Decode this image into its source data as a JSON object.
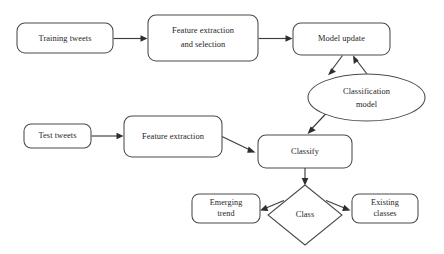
{
  "diagram": {
    "type": "flowchart",
    "colors": {
      "background": "#ffffff",
      "node_stroke": "#4a4a4a",
      "node_fill": "#ffffff",
      "edge_stroke": "#3d3d3d",
      "text": "#1e1e1e"
    },
    "nodes": [
      {
        "id": "training-tweets",
        "shape": "rounded-rect",
        "lines": [
          "Training tweets"
        ],
        "x": 17,
        "y": 23,
        "w": 96,
        "h": 30
      },
      {
        "id": "feature-extraction-selection",
        "shape": "rounded-rect",
        "lines": [
          "Feature extraction",
          "and selection"
        ],
        "x": 148,
        "y": 15,
        "w": 110,
        "h": 46
      },
      {
        "id": "model-update",
        "shape": "rounded-rect",
        "lines": [
          "Model update"
        ],
        "x": 293,
        "y": 23,
        "w": 97,
        "h": 32
      },
      {
        "id": "classification-model",
        "shape": "ellipse",
        "lines": [
          "Classification",
          "model"
        ],
        "x": 308,
        "y": 74,
        "w": 117,
        "h": 47
      },
      {
        "id": "test-tweets",
        "shape": "rounded-rect",
        "lines": [
          "Test tweets"
        ],
        "x": 24,
        "y": 124,
        "w": 67,
        "h": 24
      },
      {
        "id": "feature-extraction",
        "shape": "rounded-rect",
        "lines": [
          "Feature extraction"
        ],
        "x": 124,
        "y": 116,
        "w": 98,
        "h": 41
      },
      {
        "id": "classify",
        "shape": "rounded-rect",
        "lines": [
          "Classify"
        ],
        "x": 258,
        "y": 135,
        "w": 94,
        "h": 33
      },
      {
        "id": "class",
        "shape": "diamond",
        "lines": [
          "Class"
        ],
        "x": 268,
        "y": 185,
        "w": 74,
        "h": 60
      },
      {
        "id": "emerging-trend",
        "shape": "rounded-rect",
        "lines": [
          "Emerging",
          "trend"
        ],
        "x": 192,
        "y": 194,
        "w": 68,
        "h": 29
      },
      {
        "id": "existing-classes",
        "shape": "rounded-rect",
        "lines": [
          "Existing",
          "classes"
        ],
        "x": 352,
        "y": 194,
        "w": 66,
        "h": 29
      }
    ],
    "edges": [
      {
        "id": "training-to-feature",
        "from": "training-tweets",
        "to": "feature-extraction-selection",
        "style": "straight"
      },
      {
        "id": "feature-to-model",
        "from": "feature-extraction-selection",
        "to": "model-update",
        "style": "straight"
      },
      {
        "id": "model-to-classification",
        "from": "model-update",
        "to": "classification-model",
        "style": "diagonal"
      },
      {
        "id": "classification-to-model",
        "from": "classification-model",
        "to": "model-update",
        "style": "diagonal"
      },
      {
        "id": "classification-to-classify",
        "from": "classification-model",
        "to": "classify",
        "style": "diagonal"
      },
      {
        "id": "test-to-feature",
        "from": "test-tweets",
        "to": "feature-extraction",
        "style": "straight"
      },
      {
        "id": "feature-to-classify",
        "from": "feature-extraction",
        "to": "classify",
        "style": "diagonal"
      },
      {
        "id": "classify-to-class",
        "from": "classify",
        "to": "class",
        "style": "straight"
      },
      {
        "id": "class-to-emerging",
        "from": "class",
        "to": "emerging-trend",
        "style": "diagonal"
      },
      {
        "id": "class-to-existing",
        "from": "class",
        "to": "existing-classes",
        "style": "diagonal"
      }
    ]
  }
}
